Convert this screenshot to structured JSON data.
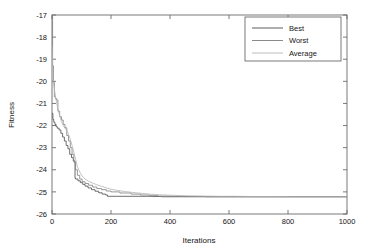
{
  "chart_data": {
    "type": "line",
    "title": "",
    "xlabel": "Iterations",
    "ylabel": "Fitness",
    "xlim": [
      0,
      1000
    ],
    "ylim": [
      -26,
      -17
    ],
    "xticks": [
      0,
      200,
      400,
      600,
      800,
      1000
    ],
    "yticks": [
      -26,
      -25,
      -24,
      -23,
      -22,
      -21,
      -20,
      -19,
      -18,
      -17
    ],
    "xticklabels": [
      "0",
      "200",
      "400",
      "600",
      "800",
      "1000"
    ],
    "yticklabels": [
      "-26",
      "-25",
      "-24",
      "-23",
      "-22",
      "-21",
      "-20",
      "-19",
      "-18",
      "-17"
    ],
    "grid": false,
    "legend_position": "upper right",
    "legend_entries": [
      "Best",
      "Worst",
      "Average"
    ],
    "colors": {
      "best": "#4a4a4a",
      "worst": "#7d7d7d",
      "average": "#b4b4b4",
      "axis": "#6b6b6b",
      "background": "#ffffff"
    },
    "series": [
      {
        "name": "Best",
        "style": "staircase",
        "x": [
          0,
          3,
          3,
          6,
          6,
          10,
          10,
          14,
          14,
          18,
          18,
          24,
          24,
          30,
          30,
          36,
          36,
          42,
          42,
          48,
          48,
          54,
          54,
          60,
          60,
          66,
          66,
          72,
          72,
          78,
          78,
          80,
          80,
          88,
          88,
          96,
          96,
          104,
          104,
          112,
          112,
          122,
          122,
          134,
          134,
          146,
          146,
          158,
          158,
          170,
          170,
          182,
          182,
          188,
          188,
          340,
          340,
          372,
          372,
          420,
          420,
          470,
          470,
          500,
          500,
          1000
        ],
        "y": [
          -21.45,
          -21.45,
          -21.72,
          -21.72,
          -21.85,
          -21.85,
          -21.95,
          -21.95,
          -22.05,
          -22.05,
          -22.12,
          -22.12,
          -22.2,
          -22.2,
          -22.35,
          -22.35,
          -22.52,
          -22.52,
          -22.7,
          -22.7,
          -22.9,
          -22.9,
          -23.05,
          -23.05,
          -23.3,
          -23.3,
          -23.45,
          -23.45,
          -23.6,
          -23.6,
          -24.38,
          -24.38,
          -24.42,
          -24.42,
          -24.5,
          -24.5,
          -24.58,
          -24.58,
          -24.66,
          -24.66,
          -24.74,
          -24.74,
          -24.82,
          -24.82,
          -24.9,
          -24.9,
          -24.97,
          -24.97,
          -25.04,
          -25.04,
          -25.1,
          -25.1,
          -25.14,
          -25.14,
          -25.2,
          -25.2,
          -25.21,
          -25.21,
          -25.22,
          -25.22,
          -25.22,
          -25.22,
          -25.22,
          -25.22,
          -25.22,
          -25.22
        ]
      },
      {
        "name": "Worst",
        "style": "staircase",
        "x": [
          0,
          2,
          2,
          5,
          5,
          8,
          8,
          12,
          12,
          16,
          16,
          20,
          20,
          26,
          26,
          32,
          32,
          38,
          38,
          44,
          44,
          50,
          50,
          56,
          56,
          62,
          62,
          68,
          68,
          74,
          74,
          80,
          80,
          86,
          86,
          94,
          94,
          102,
          102,
          112,
          112,
          124,
          124,
          138,
          138,
          152,
          152,
          168,
          168,
          184,
          184,
          200,
          200,
          230,
          230,
          268,
          268,
          300,
          300,
          330,
          330,
          360,
          360,
          400,
          400,
          450,
          450,
          520,
          520,
          600,
          600,
          700,
          700,
          1000
        ],
        "y": [
          -17.0,
          -17.0,
          -19.3,
          -19.3,
          -20.05,
          -20.05,
          -20.7,
          -20.7,
          -20.78,
          -20.78,
          -20.85,
          -20.85,
          -21.35,
          -21.35,
          -21.6,
          -21.6,
          -21.75,
          -21.75,
          -21.95,
          -21.95,
          -22.1,
          -22.1,
          -22.45,
          -22.45,
          -22.7,
          -22.7,
          -23.0,
          -23.0,
          -23.3,
          -23.3,
          -23.65,
          -23.65,
          -24.0,
          -24.0,
          -24.25,
          -24.25,
          -24.42,
          -24.42,
          -24.54,
          -24.54,
          -24.62,
          -24.62,
          -24.7,
          -24.7,
          -24.78,
          -24.78,
          -24.85,
          -24.85,
          -24.9,
          -24.9,
          -24.96,
          -24.96,
          -25.0,
          -25.0,
          -25.05,
          -25.05,
          -25.1,
          -25.1,
          -25.14,
          -25.14,
          -25.17,
          -25.17,
          -25.19,
          -25.19,
          -25.2,
          -25.2,
          -25.21,
          -25.21,
          -25.22,
          -25.22,
          -25.22,
          -25.22,
          -25.22,
          -25.22
        ]
      },
      {
        "name": "Average",
        "style": "smooth",
        "x": [
          0,
          4,
          8,
          12,
          16,
          20,
          26,
          32,
          38,
          44,
          50,
          56,
          62,
          68,
          74,
          80,
          86,
          94,
          102,
          112,
          124,
          138,
          152,
          168,
          184,
          200,
          220,
          245,
          270,
          300,
          330,
          365,
          400,
          440,
          480,
          520,
          570,
          620,
          680,
          750,
          830,
          910,
          1000
        ],
        "y": [
          -18.4,
          -20.0,
          -20.35,
          -20.7,
          -21.0,
          -21.25,
          -21.55,
          -21.82,
          -22.0,
          -22.12,
          -22.22,
          -22.4,
          -22.62,
          -22.9,
          -23.2,
          -23.52,
          -23.85,
          -24.1,
          -24.28,
          -24.42,
          -24.52,
          -24.6,
          -24.68,
          -24.75,
          -24.82,
          -24.88,
          -24.93,
          -24.98,
          -25.02,
          -25.06,
          -25.1,
          -25.13,
          -25.15,
          -25.17,
          -25.18,
          -25.19,
          -25.2,
          -25.2,
          -25.21,
          -25.21,
          -25.22,
          -25.22,
          -25.22
        ]
      }
    ]
  }
}
